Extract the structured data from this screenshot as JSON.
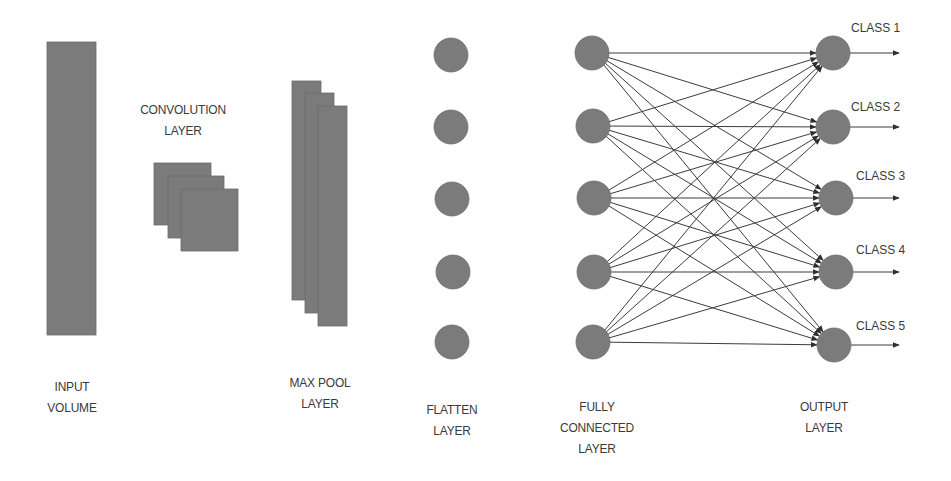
{
  "colors": {
    "shape": "#7b7b7b",
    "line": "#3c3c3c",
    "text": "#3a3a3a",
    "background": "#ffffff"
  },
  "layers": [
    {
      "id": "input",
      "label_line1": "INPUT",
      "label_line2": "VOLUME"
    },
    {
      "id": "conv",
      "label_line1": "CONVOLUTION",
      "label_line2": "LAYER"
    },
    {
      "id": "maxpool",
      "label_line1": "MAX POOL",
      "label_line2": "LAYER"
    },
    {
      "id": "flatten",
      "label_line1": "FLATTEN",
      "label_line2": "LAYER"
    },
    {
      "id": "fc",
      "label_line1": "FULLY",
      "label_line2": "CONNECTED",
      "label_line3": "LAYER"
    },
    {
      "id": "output",
      "label_line1": "OUTPUT",
      "label_line2": "LAYER"
    }
  ],
  "classes": [
    "CLASS 1",
    "CLASS 2",
    "CLASS 3",
    "CLASS 4",
    "CLASS 5"
  ],
  "geometry": {
    "input_rect": {
      "x": 47,
      "y": 42,
      "w": 49,
      "h": 293
    },
    "conv_squares": [
      {
        "x": 154,
        "y": 163,
        "w": 57,
        "h": 62
      },
      {
        "x": 168,
        "y": 176,
        "w": 56,
        "h": 62
      },
      {
        "x": 181,
        "y": 189,
        "w": 57,
        "h": 62
      }
    ],
    "maxpool_rects": [
      {
        "x": 292,
        "y": 81,
        "w": 29,
        "h": 219
      },
      {
        "x": 305,
        "y": 93,
        "w": 29,
        "h": 220
      },
      {
        "x": 318,
        "y": 106,
        "w": 29,
        "h": 220
      }
    ],
    "node_radius": 17,
    "flatten_nodes": [
      [
        451,
        55
      ],
      [
        451,
        127
      ],
      [
        452,
        199
      ],
      [
        453,
        272
      ],
      [
        452,
        342
      ]
    ],
    "fc_nodes": [
      [
        592,
        53
      ],
      [
        593,
        126
      ],
      [
        594,
        198
      ],
      [
        594,
        272
      ],
      [
        593,
        342
      ]
    ],
    "output_nodes": [
      [
        833,
        53
      ],
      [
        833,
        127
      ],
      [
        836,
        198
      ],
      [
        836,
        272
      ],
      [
        834,
        345
      ]
    ],
    "output_arrow_end_x": 899
  }
}
